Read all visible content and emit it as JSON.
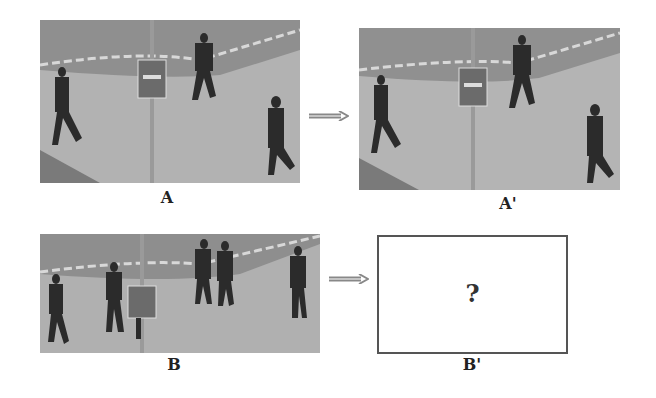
{
  "figure": {
    "panels": [
      {
        "id": "A",
        "label": "A",
        "kind": "photo",
        "description": "surveillance frame: three pedestrians walking on plaza near signpost"
      },
      {
        "id": "A_prime",
        "label": "A'",
        "kind": "photo",
        "description": "next surveillance frame: same three pedestrians slightly advanced"
      },
      {
        "id": "B",
        "label": "B",
        "kind": "photo",
        "description": "surveillance frame: five pedestrians near signpost"
      },
      {
        "id": "B_prime",
        "label": "B'",
        "kind": "placeholder",
        "placeholder_text": "?"
      }
    ],
    "arrows": [
      {
        "from": "A",
        "to": "A_prime",
        "icon": "double-line-arrow-right-icon"
      },
      {
        "from": "B",
        "to": "B_prime",
        "icon": "double-line-arrow-right-icon"
      }
    ],
    "colors": {
      "photo_gray": "#a9a9a9",
      "ground": "#b4b4b4",
      "grass": "#8e8e8e",
      "figure_dark": "#2b2b2b",
      "border": "#555555",
      "arrow": "#888888"
    }
  }
}
